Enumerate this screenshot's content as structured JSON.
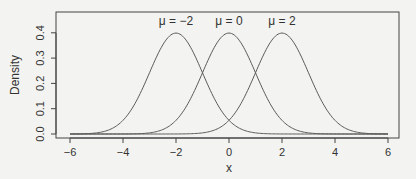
{
  "chart_data": {
    "type": "line",
    "title": "",
    "xlabel": "x",
    "ylabel": "Density",
    "xlim": [
      -6,
      6
    ],
    "ylim": [
      0,
      0.4
    ],
    "grid": false,
    "legend": "none (curves labeled inline above peaks)",
    "x_ticks": [
      -6,
      -4,
      -2,
      0,
      2,
      4,
      6
    ],
    "x_tick_labels": [
      "-6",
      "-4",
      "-2",
      "0",
      "2",
      "4",
      "6"
    ],
    "y_ticks": [
      0.0,
      0.1,
      0.2,
      0.3,
      0.4
    ],
    "y_tick_labels": [
      "0.0",
      "0.1",
      "0.2",
      "0.3",
      "0.4"
    ],
    "series": [
      {
        "name": "μ = −2",
        "label": "μ = −2",
        "mean": -2,
        "sd": 1,
        "peak_density": 0.399
      },
      {
        "name": "μ = 0",
        "label": "μ = 0",
        "mean": 0,
        "sd": 1,
        "peak_density": 0.399
      },
      {
        "name": "μ = 2",
        "label": "μ = 2",
        "mean": 2,
        "sd": 1,
        "peak_density": 0.399
      }
    ],
    "annotations": [
      "μ = −2",
      "μ = 0",
      "μ = 2"
    ]
  },
  "colors": {
    "background": "#f3f3f1",
    "curve": "#5a5a5a",
    "frame": "#444444",
    "text": "#333333"
  }
}
